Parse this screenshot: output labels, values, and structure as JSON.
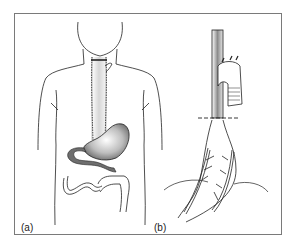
{
  "figure": {
    "panels": [
      {
        "id": "a",
        "label": "(a)",
        "content": "Front view of torso showing esophagus replaced, stomach and duodenum/small bowel"
      },
      {
        "id": "b",
        "label": "(b)",
        "content": "Side view of mobilized stomach tube with blood vessels, anastomosis site with aortic arch and dashed resection line"
      }
    ],
    "colors": {
      "frame": "#7a7a7a",
      "line": "#222222",
      "stomach_shade": "#8a8a8a",
      "bowel_shade": "#6e6e6e"
    }
  }
}
